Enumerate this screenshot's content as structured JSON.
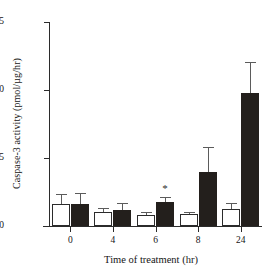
{
  "chart_data": {
    "type": "bar",
    "title": "",
    "xlabel": "Time of treatment (hr)",
    "ylabel": "Caspase-3 activity (pmol/µg/hr)",
    "categories": [
      "0",
      "4",
      "6",
      "8",
      "24"
    ],
    "ylim": [
      0,
      15
    ],
    "yticks": [
      0,
      5,
      10,
      15
    ],
    "ytick_labels": [
      "0",
      "5",
      "10",
      "15"
    ],
    "grid": false,
    "legend": "none",
    "series": [
      {
        "name": "control",
        "fill": "open",
        "values": [
          1.6,
          1.05,
          0.8,
          0.9,
          1.25
        ],
        "errors": [
          0.75,
          0.25,
          0.25,
          0.15,
          0.45
        ]
      },
      {
        "name": "treated",
        "fill": "filled",
        "values": [
          1.6,
          1.15,
          1.75,
          4.0,
          9.75
        ],
        "errors": [
          0.8,
          0.55,
          0.4,
          1.8,
          2.3
        ]
      }
    ],
    "annotations": [
      {
        "text": "*",
        "category": "6",
        "series": "treated",
        "value": 2.55
      }
    ]
  },
  "colors": {
    "axis": "#2b2b2b",
    "open_bar_fill": "#ffffff",
    "open_bar_edge": "#2b2b2b",
    "filled_bar": "#231f1c",
    "error_bar": "#5b5b5b",
    "background": "#ffffff",
    "text": "#151515"
  }
}
